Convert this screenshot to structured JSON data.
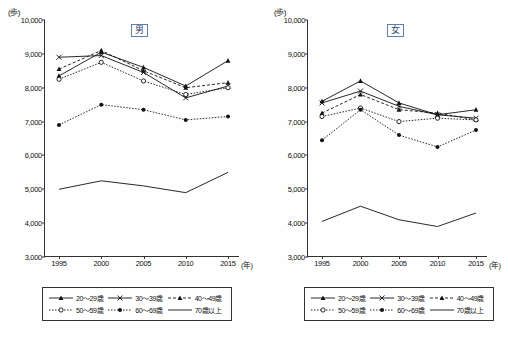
{
  "panels": [
    {
      "gender_label": "男",
      "unit_label": "(歩)",
      "x_unit_label": "(年)"
    },
    {
      "gender_label": "女",
      "unit_label": "(歩)",
      "x_unit_label": "(年)"
    }
  ],
  "legend": {
    "items": [
      {
        "label": "20～29歳",
        "marker": "triangle",
        "line": "solid"
      },
      {
        "label": "30～39歳",
        "marker": "x",
        "line": "solid"
      },
      {
        "label": "40～49歳",
        "marker": "triangle",
        "line": "dashed"
      },
      {
        "label": "50～59歳",
        "marker": "circle",
        "line": "dotted"
      },
      {
        "label": "60～69歳",
        "marker": "dot",
        "line": "dotted"
      },
      {
        "label": "70歳以上",
        "marker": "none",
        "line": "solid"
      }
    ]
  },
  "chart_data": [
    {
      "type": "line",
      "title": "男",
      "xlabel": "(年)",
      "ylabel": "(歩)",
      "x": [
        1995,
        2000,
        2005,
        2010,
        2015
      ],
      "xtick_labels": [
        "1995",
        "2000",
        "2005",
        "2010",
        "2015"
      ],
      "ylim": [
        3000,
        10000
      ],
      "ytick_labels": [
        "3,000",
        "4,000",
        "5,000",
        "6,000",
        "7,000",
        "8,000",
        "9,000",
        "10,000"
      ],
      "grid": false,
      "legend_position": "below",
      "series": [
        {
          "name": "20～29歳",
          "values": [
            8350,
            9050,
            8600,
            8050,
            8800
          ]
        },
        {
          "name": "30～39歳",
          "values": [
            8900,
            8950,
            8450,
            7700,
            8050
          ]
        },
        {
          "name": "40～49歳",
          "values": [
            8550,
            9100,
            8500,
            8000,
            8150
          ]
        },
        {
          "name": "50～59歳",
          "values": [
            8250,
            8750,
            8200,
            7800,
            8000
          ]
        },
        {
          "name": "60～69歳",
          "values": [
            6900,
            7500,
            7350,
            7050,
            7150
          ]
        },
        {
          "name": "70歳以上",
          "values": [
            5000,
            5250,
            5100,
            4900,
            5500
          ]
        }
      ]
    },
    {
      "type": "line",
      "title": "女",
      "xlabel": "(年)",
      "ylabel": "(歩)",
      "x": [
        1995,
        2000,
        2005,
        2010,
        2015
      ],
      "xtick_labels": [
        "1995",
        "2000",
        "2005",
        "2010",
        "2015"
      ],
      "ylim": [
        3000,
        10000
      ],
      "ytick_labels": [
        "3,000",
        "4,000",
        "5,000",
        "6,000",
        "7,000",
        "8,000",
        "9,000",
        "10,000"
      ],
      "grid": false,
      "legend_position": "below",
      "series": [
        {
          "name": "20～29歳",
          "values": [
            7600,
            8200,
            7550,
            7200,
            7350
          ]
        },
        {
          "name": "30～39歳",
          "values": [
            7550,
            7900,
            7450,
            7200,
            7100
          ]
        },
        {
          "name": "40～49歳",
          "values": [
            7250,
            7800,
            7350,
            7250,
            7050
          ]
        },
        {
          "name": "50～59歳",
          "values": [
            7150,
            7400,
            7000,
            7100,
            7050
          ]
        },
        {
          "name": "60～69歳",
          "values": [
            6450,
            7350,
            6600,
            6250,
            6750
          ]
        },
        {
          "name": "70歳以上",
          "values": [
            4050,
            4500,
            4100,
            3900,
            4300
          ]
        }
      ]
    }
  ]
}
